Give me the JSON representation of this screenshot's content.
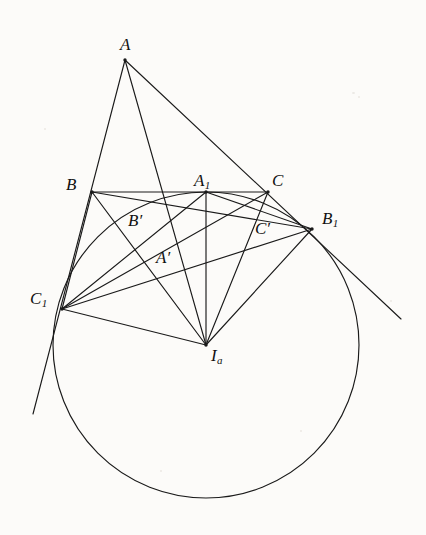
{
  "figure": {
    "background_color": "#fcfbf9",
    "stroke_color": "#1a1a1a",
    "stroke_width": 1.15
  },
  "labels": [
    {
      "key": "A",
      "text": "A",
      "sub": "",
      "prime": false,
      "x": 120,
      "y": 36
    },
    {
      "key": "B",
      "text": "B",
      "sub": "",
      "prime": false,
      "x": 66,
      "y": 176
    },
    {
      "key": "C",
      "text": "C",
      "sub": "",
      "prime": false,
      "x": 272,
      "y": 172
    },
    {
      "key": "A1",
      "text": "A",
      "sub": "1",
      "prime": false,
      "x": 194,
      "y": 172
    },
    {
      "key": "B1",
      "text": "B",
      "sub": "1",
      "prime": false,
      "x": 322,
      "y": 210
    },
    {
      "key": "C1",
      "text": "C",
      "sub": "1",
      "prime": false,
      "x": 30,
      "y": 290
    },
    {
      "key": "Ap",
      "text": "A",
      "sub": "",
      "prime": true,
      "x": 156,
      "y": 249
    },
    {
      "key": "Bp",
      "text": "B",
      "sub": "",
      "prime": true,
      "x": 128,
      "y": 212
    },
    {
      "key": "Cp",
      "text": "C",
      "sub": "",
      "prime": true,
      "x": 255,
      "y": 220
    },
    {
      "key": "Ia",
      "text": "I",
      "sub": "a",
      "prime": false,
      "x": 211,
      "y": 347
    }
  ],
  "points": {
    "A": {
      "x": 125,
      "y": 60
    },
    "B": {
      "x": 92,
      "y": 192
    },
    "C": {
      "x": 268,
      "y": 192
    },
    "A1": {
      "x": 206,
      "y": 192
    },
    "B1": {
      "x": 312,
      "y": 229
    },
    "C1": {
      "x": 62,
      "y": 309
    },
    "Ia": {
      "x": 206,
      "y": 345
    },
    "Ap": {
      "x": 163,
      "y": 261
    },
    "Bp": {
      "x": 136,
      "y": 226
    },
    "Cp": {
      "x": 263,
      "y": 239
    },
    "tangent_left_end": {
      "x": 33,
      "y": 414
    },
    "tangent_right_end": {
      "x": 401,
      "y": 319
    }
  },
  "circle": {
    "name": "A-excircle",
    "center_x": 206,
    "center_y": 345,
    "radius": 153
  },
  "segments": [
    {
      "name": "side-AB-extended-to-C1",
      "from": "A",
      "to": "tangent_left_end"
    },
    {
      "name": "side-AC-extended-to-B1",
      "from": "A",
      "to": "tangent_right_end"
    },
    {
      "name": "side-BC",
      "from": "B",
      "to": "C"
    },
    {
      "name": "cevian-A-to-Ia",
      "from": "A",
      "to": "Ia"
    },
    {
      "name": "radius-Ia-A1",
      "from": "Ia",
      "to": "A1"
    },
    {
      "name": "radius-Ia-B1",
      "from": "Ia",
      "to": "B1"
    },
    {
      "name": "radius-Ia-C1",
      "from": "Ia",
      "to": "C1"
    },
    {
      "name": "chord-C1-A1",
      "from": "C1",
      "to": "A1"
    },
    {
      "name": "chord-A1-B1",
      "from": "A1",
      "to": "B1"
    },
    {
      "name": "chord-C1-B1",
      "from": "C1",
      "to": "B1"
    },
    {
      "name": "segment-B-C1",
      "from": "B",
      "to": "C1"
    },
    {
      "name": "segment-B-B1",
      "from": "B",
      "to": "B1"
    },
    {
      "name": "segment-C-C1",
      "from": "C",
      "to": "C1"
    },
    {
      "name": "segment-C-Ia",
      "from": "C",
      "to": "Ia"
    },
    {
      "name": "segment-B-Ia",
      "from": "B",
      "to": "Ia"
    }
  ],
  "marked_feet": [
    {
      "name": "foot-A-prime",
      "point": "Ap"
    },
    {
      "name": "foot-B-prime",
      "point": "Bp"
    },
    {
      "name": "foot-C-prime",
      "point": "Cp"
    }
  ]
}
